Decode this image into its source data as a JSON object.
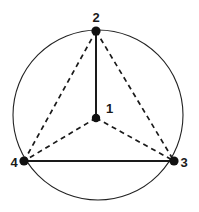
{
  "figure": {
    "title": "",
    "background_color": "#ffffff",
    "line_color": "#1a1a1a",
    "node_color": "#111111",
    "circle": {
      "name": "circumscribed-circle",
      "cx": 98,
      "cy": 115,
      "r": 85,
      "stroke": "#222222",
      "stroke_width": 1.1,
      "fill": "none"
    },
    "nodes": [
      {
        "id": "1",
        "label": "1",
        "x": 96,
        "y": 118,
        "r": 4.2,
        "label_x": 106,
        "label_y": 113,
        "label_anchor": "start"
      },
      {
        "id": "2",
        "label": "2",
        "x": 96,
        "y": 31,
        "r": 4.6,
        "label_x": 96,
        "label_y": 22,
        "label_anchor": "middle"
      },
      {
        "id": "3",
        "label": "3",
        "x": 174,
        "y": 161,
        "r": 4.6,
        "label_x": 184,
        "label_y": 167,
        "label_anchor": "middle"
      },
      {
        "id": "4",
        "label": "4",
        "x": 24,
        "y": 161,
        "r": 4.6,
        "label_x": 14,
        "label_y": 167,
        "label_anchor": "middle"
      }
    ],
    "edges": [
      {
        "id": "edge-2-1",
        "from": "2",
        "to": "1",
        "style": "solid",
        "x1": 96,
        "y1": 31,
        "x2": 96,
        "y2": 118,
        "stroke_width": 2.0
      },
      {
        "id": "edge-4-3",
        "from": "4",
        "to": "3",
        "style": "solid",
        "x1": 24,
        "y1": 161,
        "x2": 174,
        "y2": 161,
        "stroke_width": 2.0
      },
      {
        "id": "edge-2-4",
        "from": "2",
        "to": "4",
        "style": "dashed",
        "x1": 96,
        "y1": 31,
        "x2": 24,
        "y2": 161,
        "stroke_width": 1.7,
        "dash": "5,4"
      },
      {
        "id": "edge-2-3",
        "from": "2",
        "to": "3",
        "style": "dashed",
        "x1": 96,
        "y1": 31,
        "x2": 174,
        "y2": 161,
        "stroke_width": 1.7,
        "dash": "5,4"
      },
      {
        "id": "edge-1-4",
        "from": "1",
        "to": "4",
        "style": "dashed",
        "x1": 96,
        "y1": 118,
        "x2": 24,
        "y2": 161,
        "stroke_width": 1.7,
        "dash": "5,4"
      },
      {
        "id": "edge-1-3",
        "from": "1",
        "to": "3",
        "style": "dashed",
        "x1": 96,
        "y1": 118,
        "x2": 174,
        "y2": 161,
        "stroke_width": 1.7,
        "dash": "5,4"
      }
    ]
  }
}
